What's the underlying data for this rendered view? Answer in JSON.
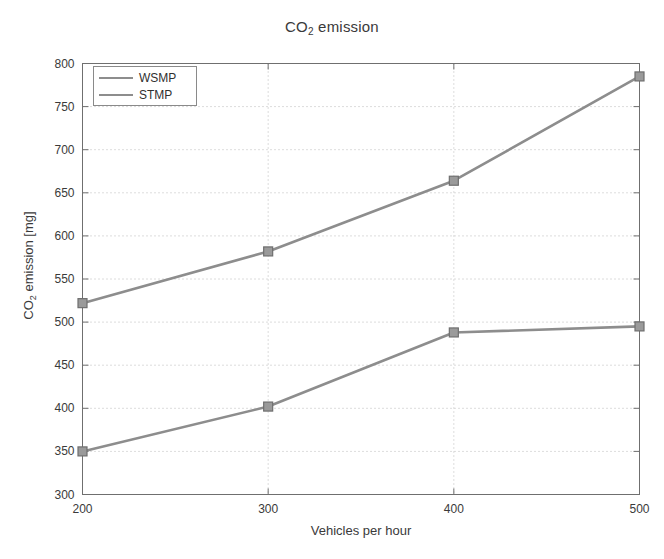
{
  "chart_data": {
    "type": "line",
    "title": "CO2 emission",
    "title_main": "CO",
    "title_sub": "2",
    "title_tail": " emission",
    "xlabel": "Vehicles per hour",
    "ylabel": "CO2 emission [mg]",
    "ylabel_main": "CO",
    "ylabel_sub": "2",
    "ylabel_tail": " emission [mg]",
    "x": [
      200,
      300,
      400,
      500
    ],
    "xticks": [
      "200",
      "300",
      "400",
      "500"
    ],
    "yticks": [
      "300",
      "350",
      "400",
      "450",
      "500",
      "550",
      "600",
      "650",
      "700",
      "750",
      "800"
    ],
    "xlim": [
      200,
      500
    ],
    "ylim": [
      300,
      800
    ],
    "grid": true,
    "legend_position": "top-left",
    "line_color": "#8d8d8d",
    "marker_color": "#8d8d8d",
    "axis_color": "#6f6f6f",
    "series": [
      {
        "name": "WSMP",
        "values": [
          350,
          402,
          488,
          495
        ]
      },
      {
        "name": "STMP",
        "values": [
          522,
          582,
          664,
          785
        ]
      }
    ]
  },
  "legend": {
    "items": [
      {
        "label": "WSMP"
      },
      {
        "label": "STMP"
      }
    ]
  }
}
